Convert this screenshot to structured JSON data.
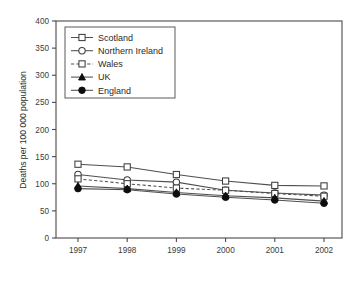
{
  "chart_data": {
    "type": "line",
    "title": "",
    "xlabel": "",
    "ylabel": "Deaths per 100 000 population",
    "categories": [
      "1997",
      "1998",
      "1999",
      "2000",
      "2001",
      "2002"
    ],
    "x": [
      1997,
      1998,
      1999,
      2000,
      2001,
      2002
    ],
    "ylim": [
      0,
      400
    ],
    "ytick_values": [
      0,
      50,
      100,
      150,
      200,
      250,
      300,
      350,
      400
    ],
    "ytick_labels": [
      "0",
      "50",
      "100",
      "150",
      "200",
      "250",
      "300",
      "350",
      "400"
    ],
    "grid": false,
    "legend_position": "upper-left-inside",
    "series": [
      {
        "name": "Scotland",
        "marker": "open-square",
        "linestyle": "solid",
        "values": [
          136,
          131,
          117,
          105,
          97,
          96
        ]
      },
      {
        "name": "Northern Ireland",
        "marker": "open-circle",
        "linestyle": "solid",
        "values": [
          117,
          107,
          103,
          88,
          83,
          79
        ]
      },
      {
        "name": "Wales",
        "marker": "open-square",
        "linestyle": "dashed",
        "values": [
          109,
          100,
          92,
          88,
          82,
          77
        ]
      },
      {
        "name": "UK",
        "marker": "filled-triangle",
        "linestyle": "solid",
        "values": [
          96,
          91,
          84,
          78,
          74,
          68
        ]
      },
      {
        "name": "England",
        "marker": "filled-circle",
        "linestyle": "solid",
        "values": [
          91,
          89,
          81,
          75,
          70,
          64
        ]
      }
    ],
    "colors": {
      "line": "#4f4f4f",
      "marker_fill_open": "#ffffff",
      "marker_fill_solid": "#0d0d0d",
      "axis": "#4a4a4a",
      "text": "#2e2e2e",
      "background": "#ffffff"
    }
  },
  "legend": {
    "entries": [
      {
        "label": "Scotland"
      },
      {
        "label": "Northern Ireland"
      },
      {
        "label": "Wales"
      },
      {
        "label": "UK"
      },
      {
        "label": "England"
      }
    ]
  }
}
